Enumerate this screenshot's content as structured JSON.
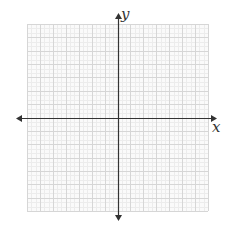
{
  "diagram": {
    "type": "coordinate-plane",
    "x_axis_label": "x",
    "y_axis_label": "y",
    "grid": {
      "left": 27,
      "top": 24,
      "right": 208,
      "bottom": 211,
      "columns": 14,
      "rows": 14,
      "origin_col": 7,
      "origin_row": 7,
      "major_color": "#d6d6d6",
      "minor_color": "#ececec",
      "background": "#fafafa"
    },
    "axis_color": "#333333"
  }
}
